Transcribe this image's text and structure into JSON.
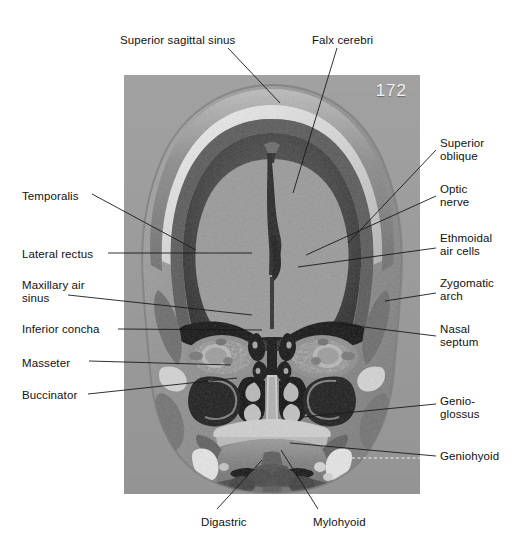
{
  "figure": {
    "plate_number": "172",
    "panel": {
      "background_color": "#9c9c9c"
    }
  },
  "labels": [
    {
      "id": "superior-sagittal-sinus",
      "text": "Superior sagittal sinus",
      "side": "top",
      "x": 120,
      "y": 34
    },
    {
      "id": "falx-cerebri",
      "text": "Falx cerebri",
      "side": "top",
      "x": 312,
      "y": 34
    },
    {
      "id": "superior-oblique",
      "text": "Superior\noblique",
      "side": "right",
      "x": 440,
      "y": 137
    },
    {
      "id": "optic-nerve",
      "text": "Optic\nnerve",
      "side": "right",
      "x": 440,
      "y": 183
    },
    {
      "id": "ethmoidal-air-cells",
      "text": "Ethmoidal\nair cells",
      "side": "right",
      "x": 440,
      "y": 232
    },
    {
      "id": "zygomatic-arch",
      "text": "Zygomatic\narch",
      "side": "right",
      "x": 440,
      "y": 277
    },
    {
      "id": "nasal-septum",
      "text": "Nasal\nseptum",
      "side": "right",
      "x": 440,
      "y": 323
    },
    {
      "id": "genioglossus",
      "text": "Genio-\nglossus",
      "side": "right",
      "x": 440,
      "y": 395
    },
    {
      "id": "geniohyoid",
      "text": "Geniohyoid",
      "side": "right",
      "x": 440,
      "y": 450
    },
    {
      "id": "temporalis",
      "text": "Temporalis",
      "side": "left",
      "x": 22,
      "y": 190
    },
    {
      "id": "lateral-rectus",
      "text": "Lateral rectus",
      "side": "left",
      "x": 22,
      "y": 248
    },
    {
      "id": "maxillary-air-sinus",
      "text": "Maxillary air\nsinus",
      "side": "left",
      "x": 22,
      "y": 279
    },
    {
      "id": "inferior-concha",
      "text": "Inferior concha",
      "side": "left",
      "x": 22,
      "y": 323
    },
    {
      "id": "masseter",
      "text": "Masseter",
      "side": "left",
      "x": 22,
      "y": 357
    },
    {
      "id": "buccinator",
      "text": "Buccinator",
      "side": "left",
      "x": 22,
      "y": 389
    },
    {
      "id": "digastric",
      "text": "Digastric",
      "side": "bottom",
      "x": 201,
      "y": 516
    },
    {
      "id": "mylohyoid",
      "text": "Mylohyoid",
      "side": "bottom",
      "x": 313,
      "y": 516
    }
  ],
  "leaders": [
    {
      "id": "leader-superior-sagittal-sinus",
      "points": "228,48 280,103"
    },
    {
      "id": "leader-falx-cerebri",
      "points": "337,48 293,193"
    },
    {
      "id": "leader-superior-oblique",
      "points": "436,150 348,243"
    },
    {
      "id": "leader-optic-nerve",
      "points": "436,196 306,255"
    },
    {
      "id": "leader-ethmoidal-air-cells",
      "points": "436,248 298,267"
    },
    {
      "id": "leader-zygomatic-arch",
      "points": "436,293 385,301"
    },
    {
      "id": "leader-nasal-septum",
      "points": "436,336 332,323"
    },
    {
      "id": "leader-genioglossus",
      "points": "436,404 303,417"
    },
    {
      "id": "leader-geniohyoid",
      "points": "436,456 290,443"
    },
    {
      "id": "leader-temporalis",
      "points": "92,194 196,250"
    },
    {
      "id": "leader-lateral-rectus",
      "points": "108,253 252,253"
    },
    {
      "id": "leader-maxillary-air-sinus",
      "points": "68,295 252,315"
    },
    {
      "id": "leader-inferior-concha",
      "points": "118,329 262,330"
    },
    {
      "id": "leader-masseter",
      "points": "89,361 231,365"
    },
    {
      "id": "leader-buccinator",
      "points": "88,394 237,378"
    },
    {
      "id": "leader-digastric",
      "points": "217,509 262,460"
    },
    {
      "id": "leader-mylohyoid",
      "points": "318,509 281,450"
    }
  ],
  "leader_overlay": {
    "geniohyoid_dashed": "352,458 420,458"
  }
}
